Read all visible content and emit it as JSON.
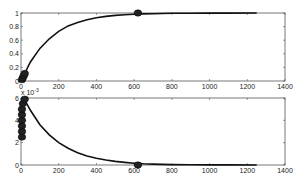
{
  "chart_data": [
    {
      "type": "line",
      "title": "",
      "xlabel": "",
      "ylabel": "",
      "xlim": [
        0,
        1400
      ],
      "ylim": [
        0,
        1
      ],
      "grid": false,
      "legend": null,
      "xticks": [
        0,
        200,
        400,
        600,
        800,
        1000,
        1200,
        1400
      ],
      "yticks": [
        0,
        0.2,
        0.4,
        0.6,
        0.8,
        1
      ],
      "ytick_labels": [
        "0",
        "0.2",
        "0.4",
        "0.6",
        "0.8",
        "1"
      ],
      "series": [
        {
          "name": "curve",
          "style": "solid-black",
          "x": [
            0,
            50,
            100,
            150,
            200,
            250,
            300,
            350,
            400,
            450,
            500,
            550,
            600,
            650,
            700,
            800,
            900,
            1000,
            1100,
            1250
          ],
          "y": [
            0.0,
            0.28,
            0.48,
            0.62,
            0.73,
            0.81,
            0.86,
            0.9,
            0.93,
            0.95,
            0.965,
            0.975,
            0.982,
            0.987,
            0.99,
            0.995,
            0.997,
            0.998,
            0.999,
            1.0
          ]
        }
      ],
      "markers": [
        {
          "x": 5,
          "y": 0.02
        },
        {
          "x": 10,
          "y": 0.05
        },
        {
          "x": 15,
          "y": 0.08
        },
        {
          "x": 20,
          "y": 0.11
        },
        {
          "x": 620,
          "y": 1.0
        }
      ]
    },
    {
      "type": "line",
      "title": "",
      "xlabel": "",
      "ylabel": "",
      "y_multiplier": "x 10^-3",
      "xlim": [
        0,
        1400
      ],
      "ylim": [
        0,
        0.006
      ],
      "grid": false,
      "legend": null,
      "xticks": [
        0,
        200,
        400,
        600,
        800,
        1000,
        1200,
        1400
      ],
      "yticks": [
        0,
        0.002,
        0.004,
        0.006
      ],
      "ytick_labels": [
        "0",
        "2",
        "4",
        "6"
      ],
      "series": [
        {
          "name": "curve",
          "style": "solid-black",
          "x": [
            20,
            50,
            100,
            150,
            200,
            250,
            300,
            350,
            400,
            450,
            500,
            550,
            600,
            650,
            700,
            800,
            900,
            1000,
            1100,
            1250
          ],
          "y": [
            0.0058,
            0.0049,
            0.0036,
            0.0027,
            0.002,
            0.0015,
            0.0011,
            0.0008,
            0.0006,
            0.00045,
            0.00032,
            0.00023,
            0.00016,
            0.00011,
            8e-05,
            4e-05,
            2e-05,
            1e-05,
            5e-06,
            0.0
          ]
        }
      ],
      "markers": [
        {
          "x": 5,
          "y": 0.0025
        },
        {
          "x": 5,
          "y": 0.003
        },
        {
          "x": 5,
          "y": 0.0035
        },
        {
          "x": 5,
          "y": 0.004
        },
        {
          "x": 5,
          "y": 0.0045
        },
        {
          "x": 5,
          "y": 0.005
        },
        {
          "x": 10,
          "y": 0.0055
        },
        {
          "x": 20,
          "y": 0.0059
        },
        {
          "x": 620,
          "y": 0.0
        }
      ]
    }
  ],
  "axes_text": {
    "top": {
      "xtick_labels": [
        "0",
        "200",
        "400",
        "600",
        "800",
        "1000",
        "1200",
        "1400"
      ],
      "ytick_labels": [
        "0",
        "0.2",
        "0.4",
        "0.6",
        "0.8",
        "1"
      ]
    },
    "bottom": {
      "multiplier_label": "x 10",
      "multiplier_exp": "-3",
      "xtick_labels": [
        "0",
        "200",
        "400",
        "600",
        "800",
        "1000",
        "1200",
        "1400"
      ],
      "ytick_labels": [
        "0",
        "2",
        "4",
        "6"
      ]
    }
  }
}
